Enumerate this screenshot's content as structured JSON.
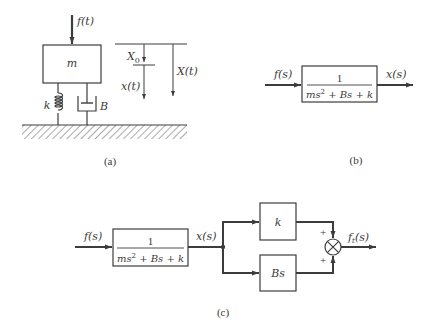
{
  "figure_a": {
    "caption": "(a)",
    "force_label": "f(t)",
    "mass_label": "m",
    "spring_label": "k",
    "damper_label": "B",
    "x0_label_main": "X",
    "x0_label_sub": "0",
    "xt_label": "x(t)",
    "Xt_label": "X(t)"
  },
  "figure_b": {
    "caption": "(b)",
    "input_label": "f(s)",
    "output_label": "x(s)",
    "tf_numerator": "1",
    "tf_den_part1": "ms",
    "tf_den_exp": "2",
    "tf_den_part2": " + Bs + k"
  },
  "figure_c": {
    "caption": "(c)",
    "input_label": "f(s)",
    "mid_label": "x(s)",
    "tf_numerator": "1",
    "tf_den_part1": "ms",
    "tf_den_exp": "2",
    "tf_den_part2": " + Bs + k",
    "upper_block_label": "k",
    "lower_block_label": "Bs",
    "sum_sign_upper": "+",
    "sum_sign_lower": "+",
    "output_label_main": "f",
    "output_label_sub": "t",
    "output_label_rest": "(s)"
  },
  "colors": {
    "line": "#3c3c3c",
    "text": "#3a3a3a",
    "background": "#ffffff"
  }
}
